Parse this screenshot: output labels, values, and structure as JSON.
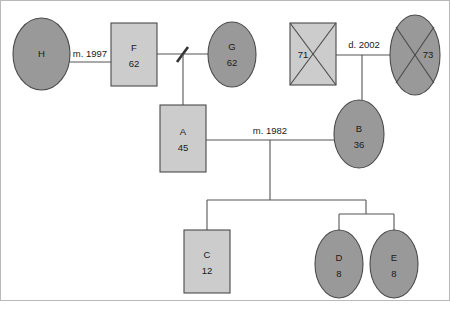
{
  "diagram": {
    "type": "genogram",
    "width": 450,
    "height": 309,
    "colors": {
      "background": "#ffffff",
      "female_fill": "#999999",
      "male_fill": "#cccccc",
      "shape_stroke": "#4a4a4a",
      "link_stroke": "#555555",
      "text": "#1a1a1a",
      "frame": "#b9b9b9"
    }
  },
  "persons": [
    {
      "id": "H",
      "name_label": "H",
      "age_label": "",
      "sex": "female",
      "shape": "ellipse",
      "deceased": false,
      "cx": 41.5,
      "cy": 54,
      "rx": 28.5,
      "ry": 36,
      "generation": 1
    },
    {
      "id": "F",
      "name_label": "F",
      "age_label": "62",
      "sex": "male",
      "shape": "rect",
      "deceased": false,
      "x": 111,
      "y": 23,
      "w": 46,
      "h": 63,
      "generation": 1
    },
    {
      "id": "G",
      "name_label": "G",
      "age_label": "62",
      "sex": "female",
      "shape": "ellipse",
      "deceased": false,
      "cx": 232,
      "cy": 54.5,
      "rx": 24,
      "ry": 32.5,
      "generation": 1
    },
    {
      "id": "P71",
      "name_label": "71",
      "age_label": "",
      "sex": "male",
      "shape": "rect",
      "deceased": true,
      "x": 290,
      "y": 23,
      "w": 46,
      "h": 62,
      "generation": 1
    },
    {
      "id": "P73",
      "name_label": "73",
      "age_label": "",
      "sex": "female",
      "shape": "ellipse",
      "deceased": true,
      "cx": 415,
      "cy": 55,
      "rx": 25,
      "ry": 40,
      "generation": 1
    },
    {
      "id": "A",
      "name_label": "A",
      "age_label": "45",
      "sex": "male",
      "shape": "rect",
      "deceased": false,
      "x": 160,
      "y": 105,
      "w": 46,
      "h": 67,
      "generation": 2
    },
    {
      "id": "B",
      "name_label": "B",
      "age_label": "36",
      "sex": "female",
      "shape": "ellipse",
      "deceased": false,
      "cx": 359,
      "cy": 134,
      "rx": 25,
      "ry": 34,
      "generation": 2
    },
    {
      "id": "C",
      "name_label": "C",
      "age_label": "12",
      "sex": "male",
      "shape": "rect",
      "deceased": false,
      "x": 184,
      "y": 230,
      "w": 46,
      "h": 63,
      "generation": 3
    },
    {
      "id": "D",
      "name_label": "D",
      "age_label": "8",
      "sex": "female",
      "shape": "ellipse",
      "deceased": false,
      "cx": 339,
      "cy": 264,
      "rx": 24,
      "ry": 34,
      "generation": 3
    },
    {
      "id": "E",
      "name_label": "E",
      "age_label": "8",
      "sex": "female",
      "shape": "ellipse",
      "deceased": false,
      "cx": 394,
      "cy": 264,
      "rx": 24,
      "ry": 34,
      "generation": 3
    }
  ],
  "relationships": [
    {
      "id": "rel-h-f",
      "partners": [
        "H",
        "F"
      ],
      "label": "m. 1997",
      "label_x": 90,
      "label_y": 54,
      "status": "married"
    },
    {
      "id": "rel-f-g",
      "partners": [
        "F",
        "G"
      ],
      "label": "",
      "status": "separated",
      "separation_x": 182,
      "separation_y": 54
    },
    {
      "id": "rel-71-73",
      "partners": [
        "P71",
        "P73"
      ],
      "label": "d. 2002",
      "label_x": 364,
      "label_y": 45,
      "status": "divorced"
    },
    {
      "id": "rel-a-b",
      "partners": [
        "A",
        "B"
      ],
      "label": "m. 1982",
      "label_x": 270,
      "label_y": 131,
      "status": "married"
    }
  ],
  "children": [
    {
      "id": "child-a",
      "parent_relationship": "rel-f-g",
      "child": "A"
    },
    {
      "id": "child-b",
      "parent_relationship": "rel-71-73",
      "child": "B"
    },
    {
      "id": "child-c",
      "parent_relationship": "rel-a-b",
      "child": "C"
    },
    {
      "id": "child-d",
      "parent_relationship": "rel-a-b",
      "child": "D",
      "twin_group": "twins-de"
    },
    {
      "id": "child-e",
      "parent_relationship": "rel-a-b",
      "child": "E",
      "twin_group": "twins-de"
    }
  ],
  "labels": {
    "h_name": "H",
    "f_name": "F",
    "f_age": "62",
    "g_name": "G",
    "g_age": "62",
    "p71_age": "71",
    "p73_age": "73",
    "a_name": "A",
    "a_age": "45",
    "b_name": "B",
    "b_age": "36",
    "c_name": "C",
    "c_age": "12",
    "d_name": "D",
    "d_age": "8",
    "e_name": "E",
    "e_age": "8",
    "m1997": "m. 1997",
    "d2002": "d. 2002",
    "m1982": "m. 1982"
  }
}
